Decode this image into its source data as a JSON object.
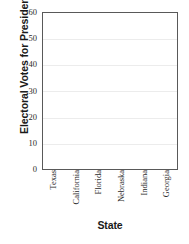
{
  "chart_data": {
    "type": "bar",
    "title": "",
    "xlabel": "State",
    "ylabel": "Electoral Votes for President",
    "categories": [
      "Texas",
      "California",
      "Florida",
      "Nebraska",
      "Indiana",
      "Georgia"
    ],
    "values": [
      null,
      null,
      null,
      null,
      null,
      null
    ],
    "ylim": [
      0,
      60
    ],
    "yticks": [
      0,
      10,
      20,
      30,
      40,
      50,
      60
    ],
    "ytick_labels": [
      "0",
      "10",
      "20",
      "30",
      "40",
      "50",
      "60"
    ],
    "grid": "horizontal",
    "legend": "none",
    "note": "empty plot area - no bars drawn"
  },
  "style": {
    "gridline_color": "#ececec",
    "axis_border_color": "#595959",
    "text_color": "#1a1a1a",
    "tick_text_color": "#2b2b2b",
    "background": "#ffffff"
  }
}
